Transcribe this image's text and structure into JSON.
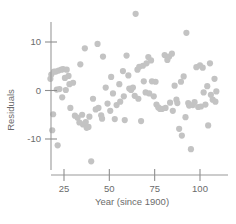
{
  "chart_data": {
    "type": "scatter",
    "title": "",
    "xlabel": "Year (since 1900)",
    "ylabel": "Residuals",
    "xticks": [
      25,
      50,
      75,
      100
    ],
    "yticks": [
      10,
      0,
      -10
    ],
    "xlim": [
      16,
      113
    ],
    "ylim": [
      -15,
      16
    ],
    "grid": false,
    "legend": null,
    "marker": {
      "shape": "circle",
      "color": "#c3c3c3",
      "size": 3.1
    },
    "axis_color": "#9a9a9a",
    "text_color": "#6b6b6b",
    "background": "#ffffff",
    "points": [
      {
        "x": 17.5,
        "y": 2.4
      },
      {
        "x": 18.0,
        "y": 3.3
      },
      {
        "x": 18.5,
        "y": -8.2
      },
      {
        "x": 19.5,
        "y": 3.9
      },
      {
        "x": 20.5,
        "y": 3.9
      },
      {
        "x": 19.0,
        "y": -4.9
      },
      {
        "x": 21.0,
        "y": 0.2
      },
      {
        "x": 22.0,
        "y": 4.1
      },
      {
        "x": 22.5,
        "y": 0.3
      },
      {
        "x": 21.5,
        "y": -11.3
      },
      {
        "x": 23.5,
        "y": 4.3
      },
      {
        "x": 24.5,
        "y": 4.4
      },
      {
        "x": 24.0,
        "y": -1.4
      },
      {
        "x": 25.5,
        "y": 2.6
      },
      {
        "x": 26.5,
        "y": 4.3
      },
      {
        "x": 26.0,
        "y": 0.1
      },
      {
        "x": 27.5,
        "y": 3.0
      },
      {
        "x": 28.0,
        "y": 1.3
      },
      {
        "x": 28.5,
        "y": -3.6
      },
      {
        "x": 30.0,
        "y": 1.6
      },
      {
        "x": 31.0,
        "y": -5.2
      },
      {
        "x": 32.5,
        "y": -5.6
      },
      {
        "x": 33.5,
        "y": -6.6
      },
      {
        "x": 34.0,
        "y": 5.4
      },
      {
        "x": 35.0,
        "y": -5.0
      },
      {
        "x": 35.5,
        "y": -7.0
      },
      {
        "x": 36.5,
        "y": 8.7
      },
      {
        "x": 37.0,
        "y": -6.5
      },
      {
        "x": 37.5,
        "y": -7.7
      },
      {
        "x": 38.5,
        "y": -7.5
      },
      {
        "x": 39.0,
        "y": -5.4
      },
      {
        "x": 40.0,
        "y": -14.6
      },
      {
        "x": 41.0,
        "y": -1.7
      },
      {
        "x": 42.5,
        "y": -3.9
      },
      {
        "x": 43.5,
        "y": 9.6
      },
      {
        "x": 44.0,
        "y": -3.6
      },
      {
        "x": 45.5,
        "y": -5.1
      },
      {
        "x": 46.5,
        "y": 7.0
      },
      {
        "x": 46.0,
        "y": -5.8
      },
      {
        "x": 48.0,
        "y": 0.6
      },
      {
        "x": 49.0,
        "y": -2.7
      },
      {
        "x": 50.5,
        "y": -4.2
      },
      {
        "x": 51.0,
        "y": 2.8
      },
      {
        "x": 52.0,
        "y": -0.6
      },
      {
        "x": 53.0,
        "y": -5.9
      },
      {
        "x": 54.0,
        "y": -3.0
      },
      {
        "x": 55.5,
        "y": 1.3
      },
      {
        "x": 56.0,
        "y": -2.3
      },
      {
        "x": 57.5,
        "y": 4.0
      },
      {
        "x": 58.0,
        "y": -1.2
      },
      {
        "x": 58.5,
        "y": -6.1
      },
      {
        "x": 59.5,
        "y": 7.2
      },
      {
        "x": 60.5,
        "y": 3.1
      },
      {
        "x": 61.0,
        "y": 0.4
      },
      {
        "x": 62.0,
        "y": 0.1
      },
      {
        "x": 63.0,
        "y": 0.6
      },
      {
        "x": 64.5,
        "y": 15.8
      },
      {
        "x": 64.0,
        "y": -1.1
      },
      {
        "x": 65.5,
        "y": 4.3
      },
      {
        "x": 66.5,
        "y": 4.9
      },
      {
        "x": 66.0,
        "y": -1.7
      },
      {
        "x": 67.5,
        "y": -6.3
      },
      {
        "x": 68.5,
        "y": 5.1
      },
      {
        "x": 69.0,
        "y": 1.9
      },
      {
        "x": 70.0,
        "y": -0.4
      },
      {
        "x": 70.5,
        "y": 5.6
      },
      {
        "x": 71.5,
        "y": 6.9
      },
      {
        "x": 72.0,
        "y": -0.6
      },
      {
        "x": 73.0,
        "y": 6.2
      },
      {
        "x": 73.5,
        "y": 1.9
      },
      {
        "x": 74.5,
        "y": -1.2
      },
      {
        "x": 75.5,
        "y": 1.8
      },
      {
        "x": 76.0,
        "y": -2.9
      },
      {
        "x": 77.0,
        "y": -3.5
      },
      {
        "x": 78.0,
        "y": -3.8
      },
      {
        "x": 79.0,
        "y": -3.8
      },
      {
        "x": 80.5,
        "y": 7.3
      },
      {
        "x": 81.0,
        "y": -3.6
      },
      {
        "x": 82.0,
        "y": 6.3
      },
      {
        "x": 83.0,
        "y": 7.0
      },
      {
        "x": 83.5,
        "y": -2.5
      },
      {
        "x": 84.5,
        "y": 7.6
      },
      {
        "x": 85.0,
        "y": -4.2
      },
      {
        "x": 86.0,
        "y": 1.0
      },
      {
        "x": 87.0,
        "y": -1.9
      },
      {
        "x": 87.5,
        "y": -2.6
      },
      {
        "x": 88.5,
        "y": -7.9
      },
      {
        "x": 89.5,
        "y": 1.8
      },
      {
        "x": 90.0,
        "y": -9.3
      },
      {
        "x": 91.0,
        "y": 2.9
      },
      {
        "x": 92.0,
        "y": -5.5
      },
      {
        "x": 92.5,
        "y": 11.9
      },
      {
        "x": 93.5,
        "y": -2.6
      },
      {
        "x": 94.0,
        "y": -3.1
      },
      {
        "x": 95.0,
        "y": -12.1
      },
      {
        "x": 96.0,
        "y": -3.0
      },
      {
        "x": 97.0,
        "y": -2.4
      },
      {
        "x": 98.0,
        "y": 4.8
      },
      {
        "x": 99.0,
        "y": -3.4
      },
      {
        "x": 100.0,
        "y": 5.2
      },
      {
        "x": 100.5,
        "y": -3.3
      },
      {
        "x": 101.5,
        "y": 4.7
      },
      {
        "x": 102.0,
        "y": -0.4
      },
      {
        "x": 103.0,
        "y": -2.9
      },
      {
        "x": 104.0,
        "y": 0.9
      },
      {
        "x": 104.5,
        "y": -7.2
      },
      {
        "x": 105.5,
        "y": 5.6
      },
      {
        "x": 106.0,
        "y": -0.9
      },
      {
        "x": 107.0,
        "y": -1.9
      },
      {
        "x": 108.0,
        "y": 2.4
      },
      {
        "x": 108.5,
        "y": -2.3
      },
      {
        "x": 109.0,
        "y": -0.2
      }
    ]
  }
}
